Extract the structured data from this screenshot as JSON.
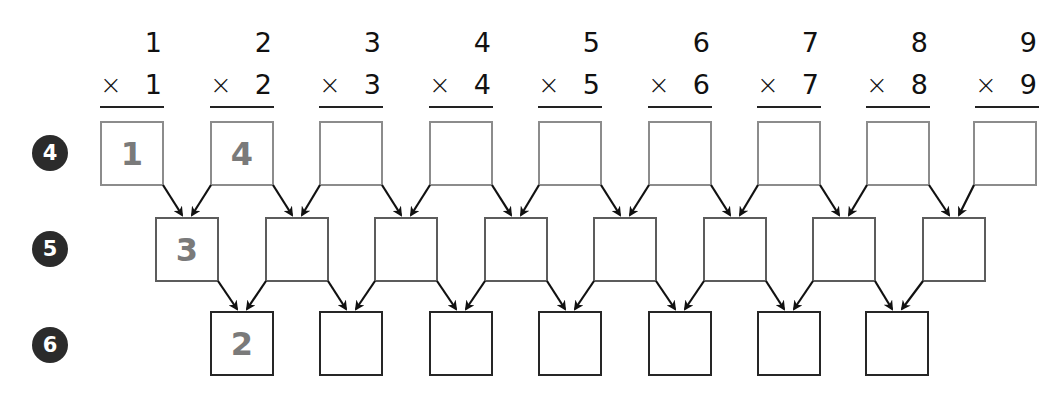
{
  "problems": [
    {
      "top": "1",
      "op": "×",
      "bottom": "1"
    },
    {
      "top": "2",
      "op": "×",
      "bottom": "2"
    },
    {
      "top": "3",
      "op": "×",
      "bottom": "3"
    },
    {
      "top": "4",
      "op": "×",
      "bottom": "4"
    },
    {
      "top": "5",
      "op": "×",
      "bottom": "5"
    },
    {
      "top": "6",
      "op": "×",
      "bottom": "6"
    },
    {
      "top": "7",
      "op": "×",
      "bottom": "7"
    },
    {
      "top": "8",
      "op": "×",
      "bottom": "8"
    },
    {
      "top": "9",
      "op": "×",
      "bottom": "9"
    }
  ],
  "rows": [
    {
      "badge": "4",
      "values": [
        "1",
        "4",
        "",
        "",
        "",
        "",
        "",
        "",
        ""
      ]
    },
    {
      "badge": "5",
      "values": [
        "3",
        "",
        "",
        "",
        "",
        "",
        "",
        ""
      ]
    },
    {
      "badge": "6",
      "values": [
        "2",
        "",
        "",
        "",
        "",
        "",
        ""
      ]
    }
  ],
  "colors": {
    "row1_border": "#8c8c8c",
    "row2_border": "#5c5c5c",
    "row3_border": "#262626",
    "filled_digit": "#7a7a7a",
    "badge_bg": "#2b2b2b",
    "arrow": "#111111"
  }
}
